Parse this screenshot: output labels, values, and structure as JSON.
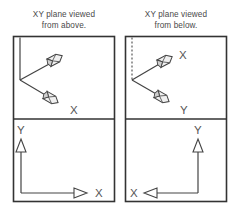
{
  "figure": {
    "title_left": "XY plane viewed",
    "title_left_line2": "from above.",
    "title_right": "XY plane viewed",
    "title_right_line2": "from below.",
    "colors": {
      "frame_stroke": "#333333",
      "axis_stroke": "#444444",
      "text": "#4a4a4a",
      "arrow_fill": "#ffffff",
      "arrow_shade": "#cfcfcf",
      "background": "#ffffff"
    }
  },
  "panels": {
    "top_left": {
      "name": "xy-plane-from-above-perspective",
      "labels": {
        "x_axis": "X",
        "y_axis": ""
      },
      "axes": [
        {
          "id": "y-axis-vertical",
          "style": "solid",
          "direction": "up",
          "arrowhead": "none"
        },
        {
          "id": "x-axis-perspective-upper",
          "style": "solid",
          "direction": "up-right",
          "arrowhead": "3d"
        },
        {
          "id": "x-axis-perspective-lower",
          "style": "solid",
          "direction": "down-right",
          "arrowhead": "3d"
        }
      ]
    },
    "top_right": {
      "name": "xy-plane-from-below-perspective",
      "labels": {
        "x_axis": "X",
        "y_axis": "Y"
      },
      "axes": [
        {
          "id": "y-axis-vertical-dashed",
          "style": "dashed",
          "direction": "up",
          "arrowhead": "none"
        },
        {
          "id": "x-axis-perspective-upper",
          "style": "solid",
          "direction": "up-right",
          "arrowhead": "3d"
        },
        {
          "id": "y-axis-perspective-lower",
          "style": "solid",
          "direction": "down-right",
          "arrowhead": "3d"
        }
      ]
    },
    "bottom_left": {
      "name": "xy-plane-from-above-flat",
      "labels": {
        "x_axis": "X",
        "y_axis": "Y"
      },
      "axes": [
        {
          "id": "y-axis-up",
          "style": "solid",
          "direction": "up",
          "arrowhead": "triangle"
        },
        {
          "id": "x-axis-right",
          "style": "solid",
          "direction": "right",
          "arrowhead": "triangle"
        }
      ]
    },
    "bottom_right": {
      "name": "xy-plane-from-below-flat",
      "labels": {
        "x_axis": "X",
        "y_axis": "Y"
      },
      "axes": [
        {
          "id": "y-axis-up",
          "style": "solid",
          "direction": "up",
          "arrowhead": "triangle"
        },
        {
          "id": "x-axis-left",
          "style": "solid",
          "direction": "left",
          "arrowhead": "triangle"
        }
      ]
    }
  }
}
